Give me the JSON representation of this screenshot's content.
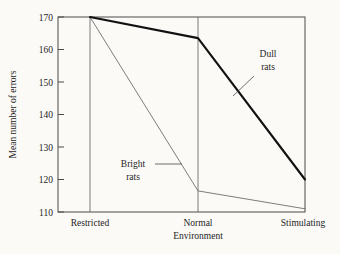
{
  "chart_data": {
    "type": "line",
    "title": "",
    "xlabel": "Environment",
    "ylabel": "Mean number of errors",
    "categories": [
      "Restricted",
      "Normal",
      "Stimulating"
    ],
    "ylim": [
      110,
      170
    ],
    "yticks": [
      110,
      120,
      130,
      140,
      150,
      160,
      170
    ],
    "ytick_labels": [
      "110",
      "120",
      "130",
      "140",
      "150",
      "160",
      "170"
    ],
    "grid": false,
    "vertical_gridlines_at": [
      "Restricted",
      "Normal"
    ],
    "legend_position": "inline-annotations",
    "series": [
      {
        "name": "Dull rats",
        "label_line_1": "Dull",
        "label_line_2": "rats",
        "values": [
          170,
          163.5,
          120
        ],
        "color": "#111111",
        "width": 2.1
      },
      {
        "name": "Bright rats",
        "label_line_1": "Bright",
        "label_line_2": "rats",
        "values": [
          170,
          116.5,
          111
        ],
        "color": "#6e6e6e",
        "width": 0.9
      }
    ]
  },
  "axis": {
    "y_tick_110": "110",
    "y_tick_120": "120",
    "y_tick_130": "130",
    "y_tick_140": "140",
    "y_tick_150": "150",
    "y_tick_160": "160",
    "y_tick_170": "170",
    "y_title": "Mean number of errors",
    "x_title": "Environment",
    "x_cat_1": "Restricted",
    "x_cat_2": "Normal",
    "x_cat_3": "Stimulating"
  },
  "annotations": {
    "dull_line_1": "Dull",
    "dull_line_2": "rats",
    "bright_line_1": "Bright",
    "bright_line_2": "rats"
  },
  "colors": {
    "background": "#fbfaf7",
    "frame": "#4a4a4a",
    "dull_series": "#111111",
    "bright_series": "#6e6e6e",
    "text": "#1d1d1d"
  }
}
